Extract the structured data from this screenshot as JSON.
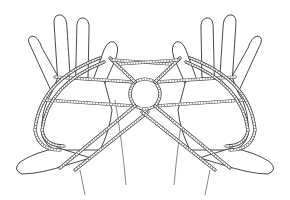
{
  "image": {
    "subject": "Line drawing of two hands holding a string figure (cat's cradle)",
    "style": "black ink line art on white",
    "colors": {
      "background": "#ffffff",
      "ink": "#333333"
    }
  }
}
